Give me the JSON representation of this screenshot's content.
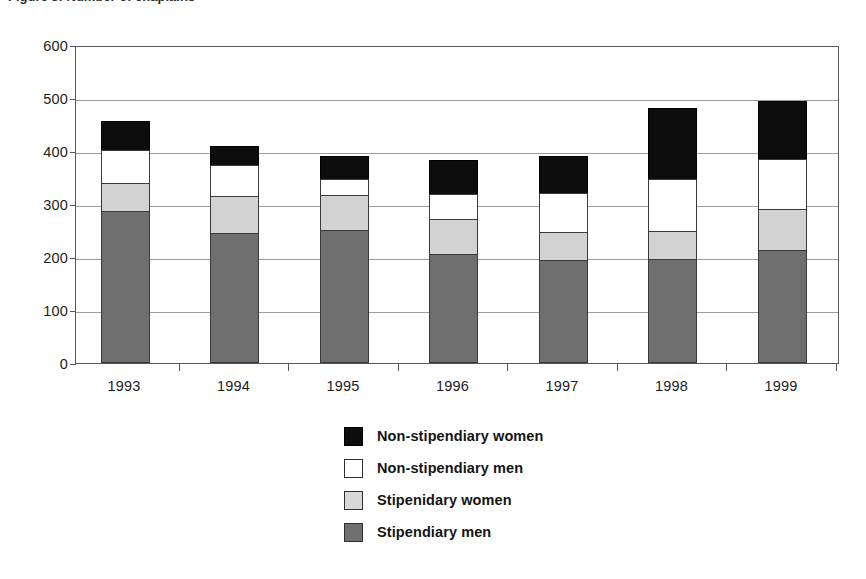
{
  "top_caption_fragment": "Figure 3: Number of chaplains",
  "chart_data": {
    "type": "bar",
    "stacked": true,
    "title": "",
    "subtitle": "",
    "xlabel": "",
    "ylabel": "",
    "categories": [
      "1993",
      "1994",
      "1995",
      "1996",
      "1997",
      "1998",
      "1999"
    ],
    "series": [
      {
        "name": "Stipendiary men",
        "color": "#6f6f6f",
        "values": [
          286,
          246,
          251,
          206,
          194,
          197,
          213
        ]
      },
      {
        "name": "Stipenidary women",
        "color": "#d2d2d2",
        "values": [
          53,
          70,
          66,
          65,
          54,
          53,
          78
        ]
      },
      {
        "name": "Non-stipendiary men",
        "color": "#ffffff",
        "values": [
          63,
          57,
          30,
          48,
          73,
          98,
          94
        ]
      },
      {
        "name": "Non-stipendiary women",
        "color": "#0d0d0d",
        "values": [
          55,
          36,
          43,
          65,
          70,
          133,
          109
        ]
      }
    ],
    "totals": [
      457,
      409,
      390,
      384,
      391,
      481,
      494
    ],
    "ylim": [
      0,
      600
    ],
    "yticks": [
      0,
      100,
      200,
      300,
      400,
      500,
      600
    ],
    "ytick_labels": [
      "0",
      "100",
      "200",
      "300",
      "400",
      "500",
      "600"
    ],
    "grid": true,
    "legend_position": "bottom-center",
    "legend_order_top_to_bottom": [
      "Non-stipendiary women",
      "Non-stipendiary men",
      "Stipenidary women",
      "Stipendiary men"
    ]
  },
  "legend": [
    {
      "label": "Non-stipendiary women",
      "swatch": "black-swatch",
      "class": "sw-nsw"
    },
    {
      "label": "Non-stipendiary men",
      "swatch": "white-swatch",
      "class": "sw-nsm"
    },
    {
      "label": "Stipenidary women",
      "swatch": "light-gray-swatch",
      "class": "sw-sw"
    },
    {
      "label": "Stipendiary men",
      "swatch": "dark-gray-swatch",
      "class": "sw-sm"
    }
  ]
}
